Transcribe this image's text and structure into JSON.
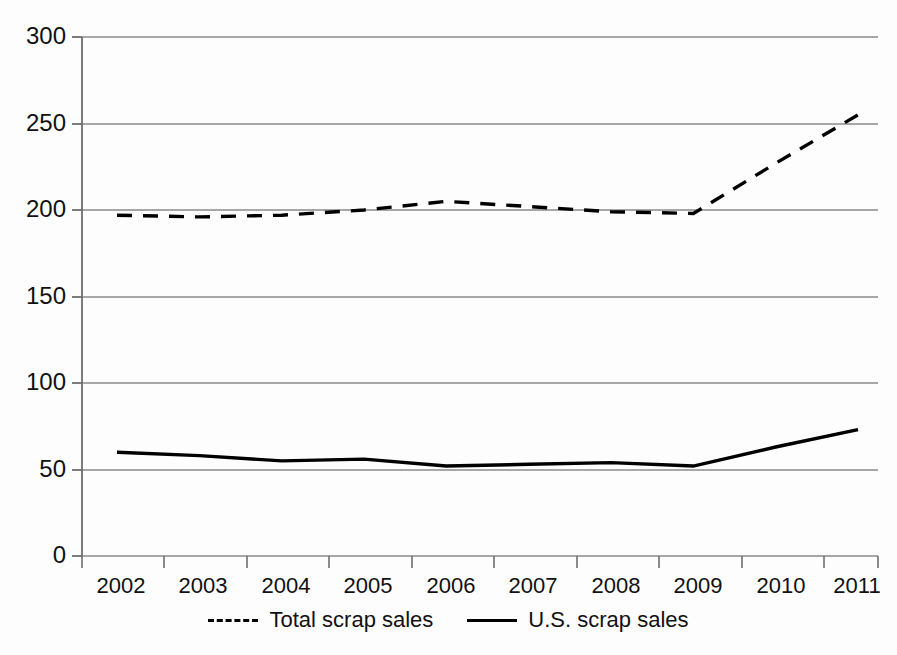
{
  "chart_data": {
    "type": "line",
    "title": "",
    "subtitle": "",
    "xlabel": "",
    "ylabel": "",
    "categories": [
      "2002",
      "2003",
      "2004",
      "2005",
      "2006",
      "2007",
      "2008",
      "2009",
      "2010",
      "2011"
    ],
    "x": [
      2002,
      2003,
      2004,
      2005,
      2006,
      2007,
      2008,
      2009,
      2010,
      2011
    ],
    "series": [
      {
        "name": "Total scrap sales",
        "style": "dashed",
        "color": "#000000",
        "values": [
          197,
          196,
          197,
          200,
          205,
          202,
          199,
          198,
          227,
          255
        ]
      },
      {
        "name": "U.S. scrap sales",
        "style": "solid",
        "color": "#000000",
        "values": [
          60,
          58,
          55,
          56,
          52,
          53,
          54,
          52,
          63,
          73
        ]
      }
    ],
    "ylim": [
      0,
      300
    ],
    "yticks": [
      0,
      50,
      100,
      150,
      200,
      250,
      300
    ],
    "ytick_labels": [
      "0",
      "50",
      "100",
      "150",
      "200",
      "250",
      "300"
    ],
    "xtick_labels": [
      "2002",
      "2003",
      "2004",
      "2005",
      "2006",
      "2007",
      "2008",
      "2009",
      "2010",
      "2011"
    ],
    "grid": true,
    "grid_axis": "y",
    "legend_position": "bottom",
    "legend": [
      {
        "label": "Total scrap sales",
        "style": "dashed"
      },
      {
        "label": "U.S. scrap sales",
        "style": "solid"
      }
    ]
  },
  "colors": {
    "line": "#000000",
    "grid": "#8a8a8a",
    "axis": "#6e6e6e",
    "text": "#111111",
    "background": "#fdfdfd"
  }
}
